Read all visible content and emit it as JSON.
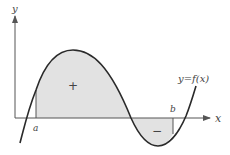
{
  "diagram": {
    "axes": {
      "x_label": "x",
      "y_label": "y"
    },
    "curve_label": "y=f(x)",
    "bounds": {
      "lower_label": "a",
      "upper_label": "b"
    },
    "regions": [
      {
        "sign": "+",
        "description": "area above x-axis, between a and first root"
      },
      {
        "sign": "−",
        "description": "area below x-axis, between second root and b"
      }
    ],
    "colors": {
      "curve": "#2a2a2a",
      "axis": "#555555",
      "fill": "#e2e2e2",
      "text": "#444444"
    }
  }
}
